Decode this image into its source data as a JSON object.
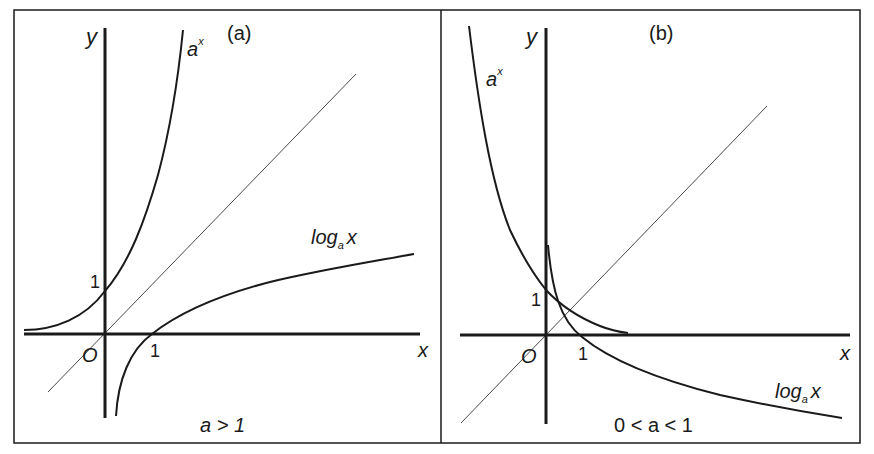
{
  "figure": {
    "panels": [
      {
        "id": "a",
        "tag": "(a)",
        "condition": "a > 1",
        "axis_x": "x",
        "axis_y": "y",
        "origin": "O",
        "tick_x": "1",
        "tick_y": "1",
        "curve_exp_base": "a",
        "curve_exp_power": "x",
        "curve_log_prefix": "log",
        "curve_log_sub": "a",
        "curve_log_arg": "x"
      },
      {
        "id": "b",
        "tag": "(b)",
        "condition": "0 < a < 1",
        "axis_x": "x",
        "axis_y": "y",
        "origin": "O",
        "tick_x": "1",
        "tick_y": "1",
        "curve_exp_base": "a",
        "curve_exp_power": "x",
        "curve_log_prefix": "log",
        "curve_log_sub": "a",
        "curve_log_arg": "x"
      }
    ],
    "colors": {
      "ink": "#1a1a1a",
      "background": "#ffffff"
    }
  }
}
